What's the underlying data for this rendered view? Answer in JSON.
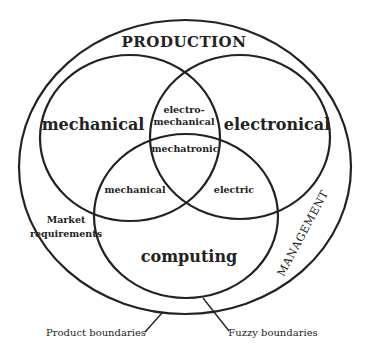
{
  "diagram": {
    "outer_label": "PRODUCTION",
    "outer_side_label": "MANAGEMENT",
    "circles": {
      "left": "mechanical",
      "right": "electronical",
      "bottom": "computing"
    },
    "intersections": {
      "left_right_line1": "electro-",
      "left_right_line2": "mechanical",
      "center": "mechatronic",
      "left_bottom": "mechanical",
      "right_bottom": "electric"
    },
    "annotations": {
      "market_line1": "Market",
      "market_line2": "requirements",
      "product_boundaries": "Product boundaries",
      "fuzzy_boundaries": "Fuzzy boundaries"
    },
    "colors": {
      "stroke": "#222222",
      "background": "#ffffff"
    }
  }
}
